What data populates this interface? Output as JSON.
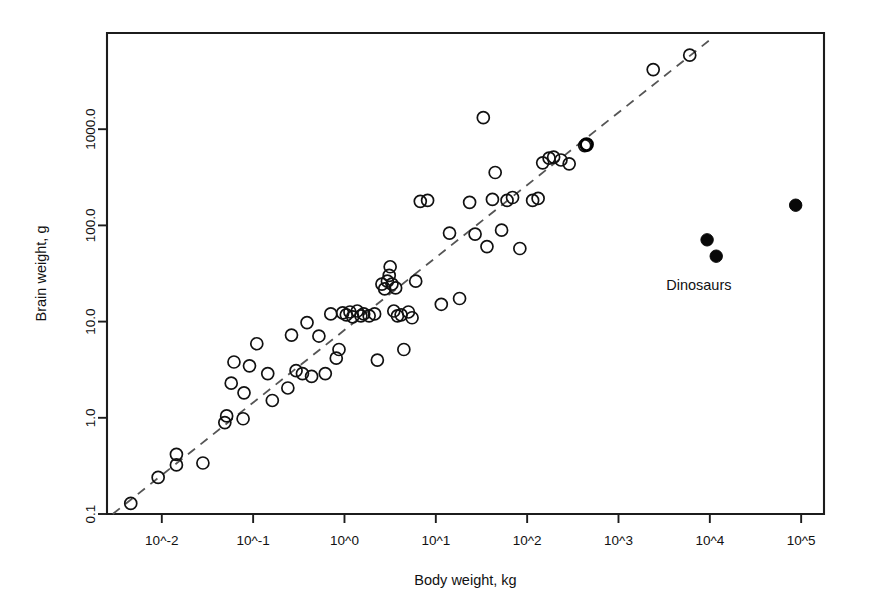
{
  "chart_data": {
    "type": "scatter",
    "title": "",
    "xlabel": "Body weight, kg",
    "ylabel": "Brain weight, g",
    "xscale": "log10",
    "yscale": "log10",
    "xlim": [
      -2.6,
      5.25
    ],
    "ylim": [
      -1.0,
      4.0
    ],
    "grid": false,
    "legend": "none",
    "xticks": [
      {
        "value": -2,
        "label": "10^-2"
      },
      {
        "value": -1,
        "label": "10^-1"
      },
      {
        "value": 0,
        "label": "10^0"
      },
      {
        "value": 1,
        "label": "10^1"
      },
      {
        "value": 2,
        "label": "10^2"
      },
      {
        "value": 3,
        "label": "10^3"
      },
      {
        "value": 4,
        "label": "10^4"
      },
      {
        "value": 5,
        "label": "10^5"
      }
    ],
    "yticks": [
      {
        "value": -1,
        "label": "0.1"
      },
      {
        "value": 0,
        "label": "1.0"
      },
      {
        "value": 1,
        "label": "10.0"
      },
      {
        "value": 2,
        "label": "100.0"
      },
      {
        "value": 3,
        "label": "1000.0"
      }
    ],
    "annotations": [
      {
        "text": "Dinosaurs",
        "x": 3.88,
        "y": 1.33
      }
    ],
    "trendline": {
      "style": "dashed",
      "color": "#555555",
      "x0": -2.55,
      "y0": -1.01,
      "x1": 3.99,
      "y1": 3.92
    },
    "series": [
      {
        "name": "Mammals",
        "marker": "open-circle",
        "color": "#111111",
        "points": [
          [
            -2.34,
            -0.89
          ],
          [
            -2.04,
            -0.62
          ],
          [
            -1.84,
            -0.49
          ],
          [
            -1.84,
            -0.38
          ],
          [
            -1.55,
            -0.47
          ],
          [
            -1.31,
            -0.05
          ],
          [
            -1.29,
            0.02
          ],
          [
            -1.24,
            0.36
          ],
          [
            -1.21,
            0.58
          ],
          [
            -1.11,
            -0.01
          ],
          [
            -1.1,
            0.26
          ],
          [
            -1.04,
            0.54
          ],
          [
            -0.96,
            0.77
          ],
          [
            -0.84,
            0.46
          ],
          [
            -0.79,
            0.18
          ],
          [
            -0.62,
            0.31
          ],
          [
            -0.58,
            0.86
          ],
          [
            -0.53,
            0.49
          ],
          [
            -0.46,
            0.46
          ],
          [
            -0.41,
            0.99
          ],
          [
            -0.36,
            0.43
          ],
          [
            -0.28,
            0.85
          ],
          [
            -0.21,
            0.46
          ],
          [
            -0.15,
            1.08
          ],
          [
            -0.09,
            0.62
          ],
          [
            -0.06,
            0.71
          ],
          [
            -0.02,
            1.09
          ],
          [
            0.02,
            1.07
          ],
          [
            0.06,
            1.1
          ],
          [
            0.09,
            1.05
          ],
          [
            0.14,
            1.11
          ],
          [
            0.18,
            1.06
          ],
          [
            0.21,
            1.08
          ],
          [
            0.27,
            1.06
          ],
          [
            0.33,
            1.08
          ],
          [
            0.36,
            0.6
          ],
          [
            0.41,
            1.39
          ],
          [
            0.44,
            1.34
          ],
          [
            0.47,
            1.42
          ],
          [
            0.49,
            1.48
          ],
          [
            0.5,
            1.57
          ],
          [
            0.52,
            1.39
          ],
          [
            0.54,
            1.11
          ],
          [
            0.56,
            1.35
          ],
          [
            0.58,
            1.06
          ],
          [
            0.62,
            1.07
          ],
          [
            0.65,
            0.71
          ],
          [
            0.7,
            1.1
          ],
          [
            0.74,
            1.04
          ],
          [
            0.78,
            1.42
          ],
          [
            0.83,
            2.25
          ],
          [
            0.91,
            2.26
          ],
          [
            1.06,
            1.18
          ],
          [
            1.15,
            1.92
          ],
          [
            1.26,
            1.24
          ],
          [
            1.37,
            2.24
          ],
          [
            1.43,
            1.91
          ],
          [
            1.52,
            3.12
          ],
          [
            1.56,
            1.78
          ],
          [
            1.62,
            2.27
          ],
          [
            1.65,
            2.55
          ],
          [
            1.72,
            1.95
          ],
          [
            1.78,
            2.26
          ],
          [
            1.84,
            2.29
          ],
          [
            1.92,
            1.76
          ],
          [
            2.06,
            2.26
          ],
          [
            2.12,
            2.28
          ],
          [
            2.17,
            2.65
          ],
          [
            2.24,
            2.7
          ],
          [
            2.29,
            2.71
          ],
          [
            2.37,
            2.68
          ],
          [
            2.46,
            2.64
          ],
          [
            2.63,
            2.83
          ],
          [
            3.38,
            3.62
          ],
          [
            3.78,
            3.77
          ]
        ]
      },
      {
        "name": "Human",
        "marker": "open-circle-bold",
        "color": "#000000",
        "points": [
          [
            2.65,
            2.84
          ]
        ]
      },
      {
        "name": "Dinosaurs",
        "marker": "filled-circle",
        "color": "#080808",
        "points": [
          [
            3.97,
            1.85
          ],
          [
            4.07,
            1.68
          ],
          [
            4.94,
            2.21
          ]
        ]
      }
    ]
  },
  "figure": {
    "background_color": "#ffffff",
    "frame_color": "#1c1c1c"
  }
}
